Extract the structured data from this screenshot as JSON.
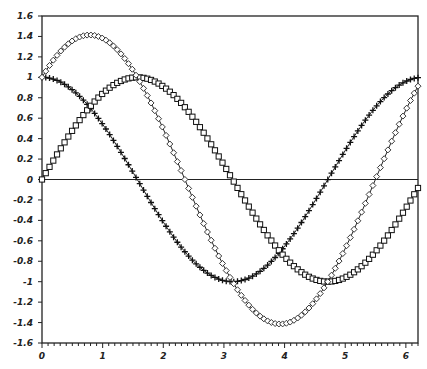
{
  "chart_data": {
    "type": "line",
    "title": "",
    "xlabel": "",
    "ylabel": "",
    "xlim": [
      0,
      6.2
    ],
    "ylim": [
      -1.6,
      1.6
    ],
    "grid": false,
    "legend": null,
    "x_ticks": [
      "0",
      "1",
      "2",
      "3",
      "4",
      "5",
      "6"
    ],
    "y_ticks": [
      "1.6",
      "1.4",
      "1.2",
      "1",
      "0.8",
      "0.6",
      "0.4",
      "0.2",
      "0",
      "-0.2",
      "-0.4",
      "-0.6",
      "-0.8",
      "-1",
      "-1.2",
      "-1.4",
      "-1.6"
    ],
    "series": [
      {
        "name": "cos(x)",
        "marker": "plus",
        "function": "cos",
        "x_range": [
          0,
          6.2
        ],
        "samples": 100,
        "key_points": [
          [
            0,
            1
          ],
          [
            0.785,
            0.707
          ],
          [
            1.571,
            0
          ],
          [
            3.142,
            -1
          ],
          [
            4.712,
            0
          ],
          [
            6.2,
            0.996
          ]
        ]
      },
      {
        "name": "sin(x)",
        "marker": "square",
        "function": "sin",
        "x_range": [
          0,
          6.2
        ],
        "samples": 100,
        "key_points": [
          [
            0,
            0
          ],
          [
            0.785,
            0.707
          ],
          [
            1.571,
            1
          ],
          [
            3.142,
            0
          ],
          [
            4.712,
            -1
          ],
          [
            6.2,
            -0.083
          ]
        ]
      },
      {
        "name": "sin(x)+cos(x)",
        "marker": "diamond",
        "function": "sincos",
        "x_range": [
          0,
          6.2
        ],
        "samples": 100,
        "key_points": [
          [
            0,
            1
          ],
          [
            0.785,
            1.414
          ],
          [
            2.356,
            0
          ],
          [
            3.927,
            -1.414
          ],
          [
            5.498,
            0
          ],
          [
            6.2,
            0.913
          ]
        ]
      }
    ]
  }
}
